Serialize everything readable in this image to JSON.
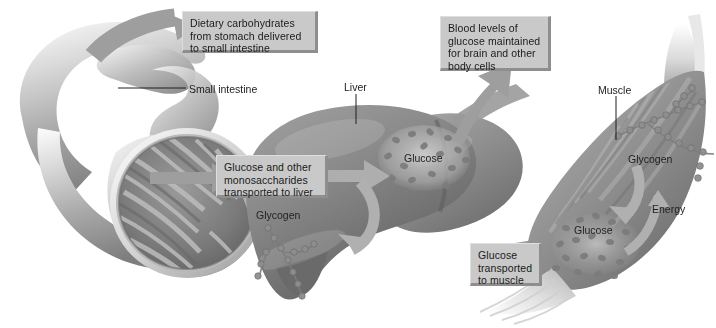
{
  "figure": {
    "background_color": "#ffffff",
    "callout_fill": "#c9c9c9",
    "callout_shadow": "#8e8e8e",
    "text_color": "#1a1a1a",
    "organ_tone": "#8a8a8a",
    "arrow_color": "#a8a8a8"
  },
  "callouts": [
    {
      "id": "dietary-carbohydrates",
      "text": "Dietary carbohydrates\nfrom stomach delivered\nto small intestine",
      "x": 182,
      "y": 11,
      "w": 136,
      "h": 42
    },
    {
      "id": "blood-glucose",
      "text": "Blood levels of\nglucose maintained\nfor brain and other\nbody cells",
      "x": 440,
      "y": 16,
      "w": 111,
      "h": 55
    },
    {
      "id": "glucose-to-liver",
      "text": "Glucose and other\nmonosaccharides\ntransported to liver",
      "x": 216,
      "y": 155,
      "w": 112,
      "h": 43
    },
    {
      "id": "glucose-to-muscle",
      "text": "Glucose\ntransported\nto muscle",
      "x": 470,
      "y": 243,
      "w": 72,
      "h": 43
    }
  ],
  "leader_labels": [
    {
      "id": "small-intestine",
      "text": "Small intestine",
      "x": 189,
      "y": 83
    },
    {
      "id": "liver",
      "text": "Liver",
      "x": 344,
      "y": 81
    },
    {
      "id": "muscle",
      "text": "Muscle",
      "x": 598,
      "y": 84
    }
  ],
  "organ_labels": [
    {
      "id": "liver-glucose",
      "text": "Glucose",
      "x": 404,
      "y": 152
    },
    {
      "id": "liver-glycogen",
      "text": "Glycogen",
      "x": 256,
      "y": 209
    },
    {
      "id": "muscle-glycogen",
      "text": "Glycogen",
      "x": 628,
      "y": 153
    },
    {
      "id": "muscle-energy",
      "text": "Energy",
      "x": 652,
      "y": 203
    },
    {
      "id": "muscle-glucose",
      "text": "Glucose",
      "x": 574,
      "y": 224
    }
  ],
  "structures": [
    {
      "id": "small-intestine-organ",
      "label": "small intestine"
    },
    {
      "id": "liver-organ",
      "label": "liver"
    },
    {
      "id": "muscle-organ",
      "label": "skeletal muscle"
    }
  ],
  "flow_arrows": [
    {
      "id": "arrow-carbs-into-intestine",
      "from": "stomach",
      "to": "small intestine"
    },
    {
      "id": "arrow-intestine-to-liver",
      "from": "small intestine",
      "to": "liver"
    },
    {
      "id": "arrow-liver-to-glucose",
      "from": "liver",
      "to": "glucose pool"
    },
    {
      "id": "arrow-glycogen-glucose-loop",
      "from": "glycogen",
      "to": "glucose"
    },
    {
      "id": "arrow-liver-to-blood",
      "from": "liver",
      "to": "blood"
    },
    {
      "id": "arrow-liver-to-muscle",
      "from": "liver",
      "to": "muscle"
    },
    {
      "id": "arrow-muscle-glycogen-to-glucose",
      "from": "muscle glycogen",
      "to": "muscle glucose"
    },
    {
      "id": "arrow-muscle-glucose-to-energy",
      "from": "muscle glucose",
      "to": "energy"
    }
  ]
}
